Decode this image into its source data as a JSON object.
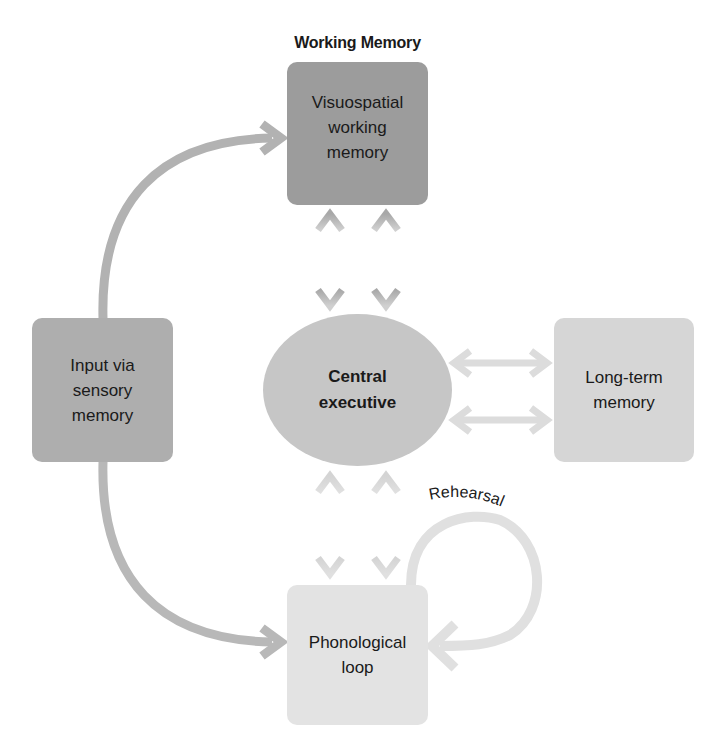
{
  "diagram": {
    "title": "Working Memory",
    "nodes": {
      "visuospatial": {
        "lines": [
          "Visuospatial",
          "working",
          "memory"
        ],
        "color": "#9c9c9c"
      },
      "input": {
        "lines": [
          "Input via",
          "sensory",
          "memory"
        ],
        "color": "#aeaeae"
      },
      "central": {
        "lines": [
          "Central",
          "executive"
        ],
        "color": "#c6c6c6"
      },
      "long_term": {
        "lines": [
          "Long-term",
          "memory"
        ],
        "color": "#d6d6d6"
      },
      "phonological": {
        "lines": [
          "Phonological",
          "loop"
        ],
        "color": "#e3e3e3"
      }
    },
    "edges": [
      {
        "from": "input",
        "to": "visuospatial",
        "type": "curved-arrow"
      },
      {
        "from": "input",
        "to": "phonological",
        "type": "curved-arrow"
      },
      {
        "from": "visuospatial",
        "to": "central",
        "type": "double-arrow",
        "count": 2
      },
      {
        "from": "central",
        "to": "phonological",
        "type": "double-arrow",
        "count": 2
      },
      {
        "from": "central",
        "to": "long_term",
        "type": "double-arrow",
        "count": 2
      },
      {
        "from": "phonological",
        "to": "phonological",
        "type": "loop-arrow",
        "label": "Rehearsal"
      }
    ],
    "rehearsal_label": "Rehearsal"
  }
}
